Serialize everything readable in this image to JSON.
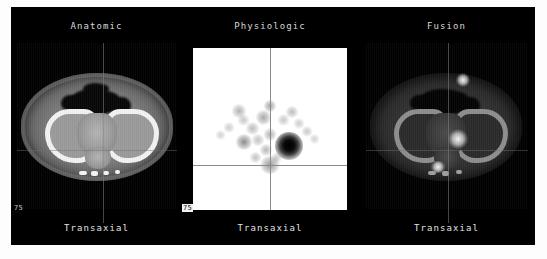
{
  "viewer": {
    "background_color": "#000000",
    "page_background_color": "#ffffff"
  },
  "panels": [
    {
      "id": "anatomic",
      "title": "Anatomic",
      "orientation_label": "Transaxial",
      "slice_index": "75",
      "modality_style": "grayscale-ct",
      "slice_index_color": "#c9c9c9"
    },
    {
      "id": "physiologic",
      "title": "Physiologic",
      "orientation_label": "Transaxial",
      "slice_index": "75",
      "modality_style": "inverted-grayscale-pet",
      "slice_index_color": "#111111"
    },
    {
      "id": "fusion",
      "title": "Fusion",
      "orientation_label": "Transaxial",
      "slice_index": "",
      "modality_style": "fused-petct",
      "slice_index_color": "#c9c9c9"
    }
  ],
  "colors": {
    "panel_background": "#000000",
    "title_text": "#d8d8d8",
    "footer_text": "#e2e2e2",
    "pet_background": "#ffffff",
    "crosshair": "#8a8a8a"
  }
}
